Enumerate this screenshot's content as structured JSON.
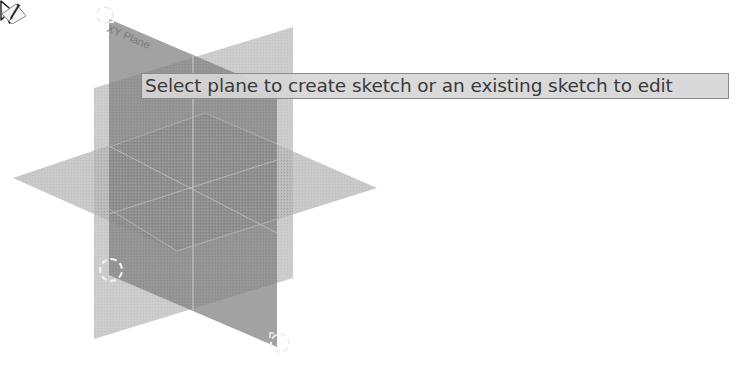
{
  "viewport": {
    "background": "#ffffff",
    "planes": {
      "xy_plane": {
        "label": "XY Plane",
        "color": "#8c8c8c",
        "points": "109,19 277,91 277,347 109,275"
      },
      "yz_plane": {
        "color": "#c4c4c4",
        "points": "94,88 293,27 293,278 94,339"
      },
      "xz_plane": {
        "color": "#c8c8c8",
        "points": "13,178 205,113 377,188 177,251"
      }
    }
  },
  "tooltip": {
    "text": "Select plane to create sketch or an existing sketch to edit"
  },
  "cursor": {
    "icon": "arrow-cursor-icon",
    "badge_icon": "sketch-pencil-icon"
  },
  "handles": [
    {
      "name": "plane-resize-handle-top-left"
    },
    {
      "name": "plane-resize-handle-bottom-left"
    },
    {
      "name": "plane-resize-handle-bottom-right"
    }
  ]
}
